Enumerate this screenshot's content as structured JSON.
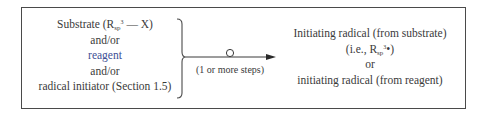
{
  "diagram": {
    "left": {
      "lines": [
        {
          "text": "Substrate (R",
          "sub": "sp",
          "sup": "3",
          "after": " — X)"
        },
        {
          "text": "and/or"
        },
        {
          "text": "reagent",
          "color": "#3d4f94"
        },
        {
          "text": "and/or"
        },
        {
          "text": "radical initiator (Section 1.5)"
        }
      ]
    },
    "arrow": {
      "label": "(1 or more steps)",
      "marker": "circle"
    },
    "right": {
      "lines": [
        {
          "text": "Initiating radical (from substrate)"
        },
        {
          "text": "(i.e., R",
          "sub": "sp",
          "sup": "3",
          "after": "•)"
        },
        {
          "text": "or"
        },
        {
          "text": "initiating radical (from reagent)"
        }
      ]
    },
    "colors": {
      "frame": "#4a4a4a",
      "text": "#3a3a3a",
      "reagent": "#3d4f94"
    }
  }
}
